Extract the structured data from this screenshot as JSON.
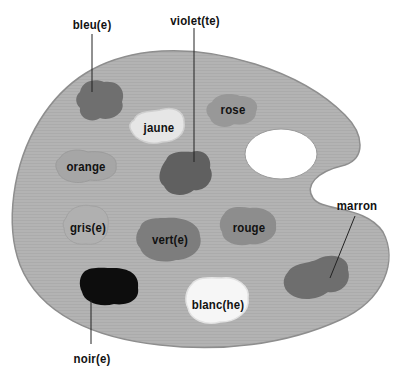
{
  "diagram": {
    "colors": {
      "palette_fill": "#b3b3b3",
      "palette_edge": "#8e8e8e",
      "background": "#ffffff",
      "leader_line": "#222222"
    },
    "labels": {
      "bleu": "bleu(e)",
      "violet": "violet(te)",
      "jaune": "jaune",
      "rose": "rose",
      "orange": "orange",
      "gris": "gris(e)",
      "vert": "vert(e)",
      "rouge": "rouge",
      "marron": "marron",
      "noir": "noir(e)",
      "blanc": "blanc(he)"
    },
    "blobs": [
      {
        "id": "bleu",
        "fill": "#6f6f6f"
      },
      {
        "id": "violet",
        "fill": "#606060"
      },
      {
        "id": "jaune",
        "fill": "#e6e6e6"
      },
      {
        "id": "rose",
        "fill": "#989898"
      },
      {
        "id": "orange",
        "fill": "#a6a6a6"
      },
      {
        "id": "gris",
        "fill": "#b0b0b0"
      },
      {
        "id": "vert",
        "fill": "#7d7d7d"
      },
      {
        "id": "rouge",
        "fill": "#8d8d8d"
      },
      {
        "id": "marron",
        "fill": "#6e6e6e"
      },
      {
        "id": "noir",
        "fill": "#0d0d0d"
      },
      {
        "id": "blanc",
        "fill": "#f6f6f6"
      }
    ]
  }
}
